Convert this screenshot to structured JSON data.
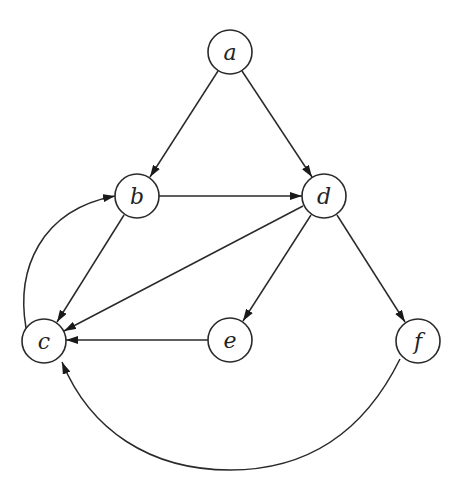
{
  "diagram": {
    "type": "directed-graph",
    "nodes": [
      {
        "id": "a",
        "label": "a",
        "x": 230,
        "y": 52
      },
      {
        "id": "b",
        "label": "b",
        "x": 137,
        "y": 196
      },
      {
        "id": "c",
        "label": "c",
        "x": 44,
        "y": 341
      },
      {
        "id": "d",
        "label": "d",
        "x": 324,
        "y": 196
      },
      {
        "id": "e",
        "label": "e",
        "x": 230,
        "y": 340
      },
      {
        "id": "f",
        "label": "f",
        "x": 418,
        "y": 341
      }
    ],
    "edges": [
      {
        "from": "a",
        "to": "b"
      },
      {
        "from": "a",
        "to": "d"
      },
      {
        "from": "b",
        "to": "d"
      },
      {
        "from": "b",
        "to": "c"
      },
      {
        "from": "c",
        "to": "b",
        "curved": true
      },
      {
        "from": "d",
        "to": "c"
      },
      {
        "from": "d",
        "to": "e"
      },
      {
        "from": "d",
        "to": "f"
      },
      {
        "from": "e",
        "to": "c"
      },
      {
        "from": "f",
        "to": "c",
        "curved": true
      }
    ],
    "colors": {
      "stroke": "#2a2a2a",
      "background": "#ffffff"
    }
  }
}
